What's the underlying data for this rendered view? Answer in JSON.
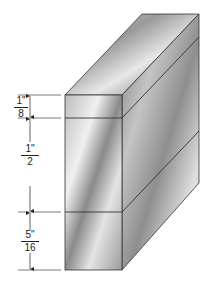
{
  "diagram": {
    "type": "isometric-block-dimensioned",
    "dimensions": [
      {
        "id": "top",
        "numerator": "1\"",
        "denominator": "8",
        "value": "1/8 inch"
      },
      {
        "id": "middle",
        "numerator": "1\"",
        "denominator": "2",
        "value": "1/2 inch"
      },
      {
        "id": "bottom",
        "numerator": "5\"",
        "denominator": "16",
        "value": "5/16 inch"
      }
    ],
    "colors": {
      "line": "#222222",
      "metal_light": "#e6e6e6",
      "metal_mid": "#a8a8a8",
      "metal_dark": "#6e6e6e"
    }
  }
}
